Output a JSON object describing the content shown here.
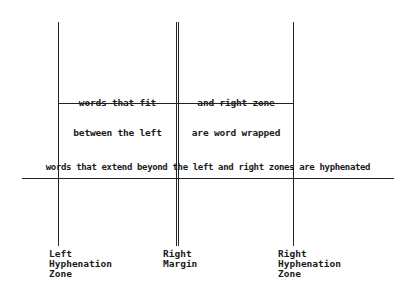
{
  "diagram": {
    "left_zone_text": [
      "words that fit",
      "between the left"
    ],
    "right_zone_text": [
      "and right zone",
      "are word wrapped"
    ],
    "hyphen_text": "words that extend beyond the left and right zones are hyphenated",
    "labels": {
      "left_hyphenation_zone": [
        "Left",
        "Hyphenation",
        "Zone"
      ],
      "right_margin": [
        "Right",
        "Margin"
      ],
      "right_hyphenation_zone": [
        "Right",
        "Hyphenation",
        "Zone"
      ]
    }
  }
}
